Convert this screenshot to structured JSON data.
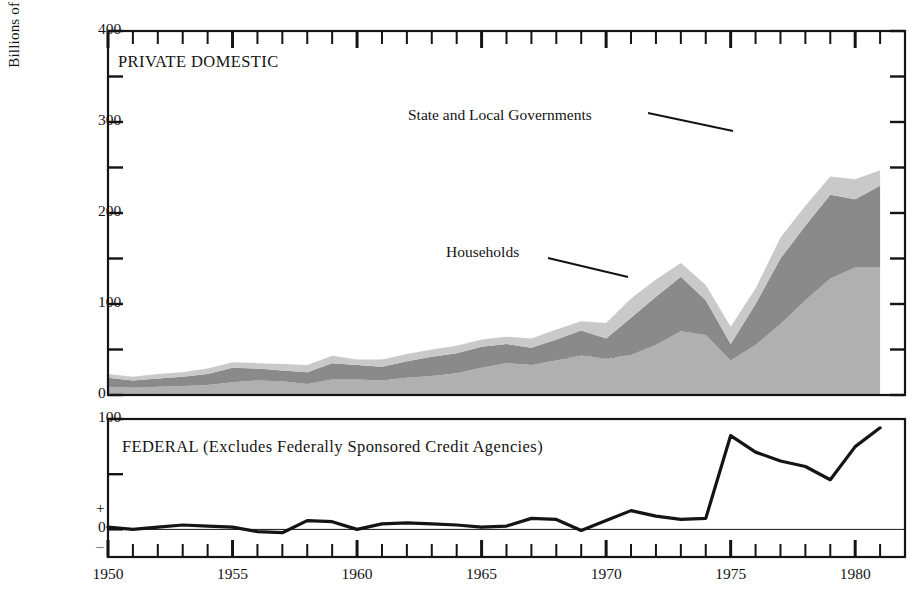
{
  "axis": {
    "y_label": "Billions of Dollars",
    "top_panel": {
      "ticks_major": [
        0,
        100,
        200,
        300,
        400
      ],
      "ticks_minor": [
        50,
        150,
        250,
        350
      ],
      "ylim": [
        0,
        400
      ]
    },
    "bottom_panel": {
      "ticks_major": [
        0,
        100
      ],
      "ticks_minor": [
        50
      ],
      "sign_plus": "+",
      "sign_minus": "–",
      "ylim": [
        -25,
        100
      ]
    },
    "x_ticks_major": [
      1950,
      1955,
      1960,
      1965,
      1970,
      1975,
      1980
    ],
    "x_ticks_minor_start": 1950,
    "x_ticks_minor_end": 1982,
    "xlim": [
      1950,
      1982
    ]
  },
  "panels": {
    "private": {
      "title": "PRIVATE DOMESTIC"
    },
    "federal": {
      "title": "FEDERAL (Excludes Federally Sponsored Credit Agencies)"
    }
  },
  "annotations": [
    {
      "name": "state-and-local-governments",
      "text": "State and Local Governments"
    },
    {
      "name": "households",
      "text": "Households"
    },
    {
      "name": "business",
      "text": "Business"
    }
  ],
  "colors": {
    "business": "#b0b0b0",
    "households": "#8a8a8a",
    "state_local": "#c9c9c9",
    "axis": "#141414",
    "federal_line": "#141414"
  },
  "chart_data": {
    "type": "area",
    "title": "PRIVATE DOMESTIC",
    "subtitle": "FEDERAL (Excludes Federally Sponsored Credit Agencies)",
    "xlabel": "",
    "ylabel": "Billions of Dollars",
    "ylim": [
      0,
      400
    ],
    "xlim": [
      1950,
      1982
    ],
    "grid": false,
    "legend": "inline-annotations",
    "stacked": true,
    "x": [
      1950,
      1951,
      1952,
      1953,
      1954,
      1955,
      1956,
      1957,
      1958,
      1959,
      1960,
      1961,
      1962,
      1963,
      1964,
      1965,
      1966,
      1967,
      1968,
      1969,
      1970,
      1971,
      1972,
      1973,
      1974,
      1975,
      1976,
      1977,
      1978,
      1979,
      1980,
      1981
    ],
    "series": [
      {
        "name": "Business",
        "values": [
          9,
          8,
          9,
          10,
          11,
          14,
          16,
          15,
          12,
          17,
          17,
          16,
          19,
          21,
          24,
          30,
          35,
          33,
          38,
          44,
          40,
          44,
          55,
          70,
          66,
          38,
          55,
          78,
          104,
          128,
          140,
          140
        ]
      },
      {
        "name": "Households",
        "values": [
          10,
          8,
          9,
          10,
          12,
          16,
          13,
          12,
          13,
          18,
          16,
          15,
          18,
          21,
          22,
          23,
          21,
          19,
          23,
          27,
          22,
          41,
          53,
          60,
          38,
          18,
          45,
          72,
          82,
          92,
          75,
          90
        ]
      },
      {
        "name": "State and Local Governments",
        "values": [
          4,
          4,
          5,
          5,
          6,
          6,
          6,
          7,
          8,
          8,
          6,
          8,
          8,
          8,
          8,
          8,
          8,
          10,
          11,
          10,
          17,
          21,
          19,
          15,
          17,
          19,
          17,
          23,
          22,
          20,
          22,
          17
        ]
      }
    ],
    "totals": [
      23,
      20,
      23,
      25,
      29,
      36,
      35,
      34,
      33,
      43,
      39,
      39,
      45,
      50,
      54,
      61,
      64,
      62,
      72,
      81,
      79,
      106,
      127,
      145,
      121,
      75,
      117,
      173,
      208,
      240,
      237,
      247
    ],
    "federal_series": {
      "name": "Federal",
      "type": "line",
      "ylim": [
        -25,
        100
      ],
      "values": [
        2,
        0,
        2,
        4,
        3,
        2,
        -2,
        -3,
        8,
        7,
        0,
        5,
        6,
        5,
        4,
        2,
        3,
        10,
        9,
        -1,
        8,
        17,
        12,
        9,
        10,
        85,
        70,
        62,
        57,
        45,
        75,
        92
      ]
    }
  }
}
